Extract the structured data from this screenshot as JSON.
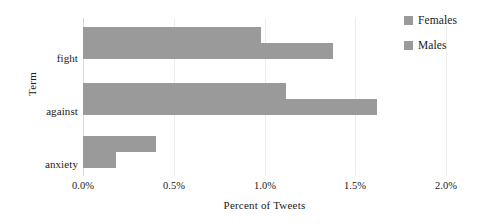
{
  "chart_data": {
    "type": "bar",
    "orientation": "horizontal",
    "title": "",
    "xlabel": "Percent of Tweets",
    "ylabel": "Term",
    "categories": [
      "fight",
      "against",
      "anxiety"
    ],
    "series": [
      {
        "name": "Females",
        "color": "#9a9a9a",
        "values": [
          0.98,
          1.12,
          0.4
        ]
      },
      {
        "name": "Males",
        "color": "#9a9a9a",
        "values": [
          1.38,
          1.62,
          0.18
        ]
      }
    ],
    "xlim": [
      0.0,
      2.0
    ],
    "xticks": [
      0.0,
      0.5,
      1.0,
      1.5,
      2.0
    ],
    "xtick_labels": [
      "0.0%",
      "0.5%",
      "1.0%",
      "1.5%",
      "2.0%"
    ],
    "grid": "vertical",
    "legend_position": "top-right",
    "bar_fill_color": "#9a9a9a",
    "gridline_color": "#ececec"
  },
  "axes": {
    "y_title": "Term",
    "x_title": "Percent of Tweets"
  },
  "legend": {
    "items": [
      {
        "label": "Females"
      },
      {
        "label": "Males"
      }
    ]
  }
}
